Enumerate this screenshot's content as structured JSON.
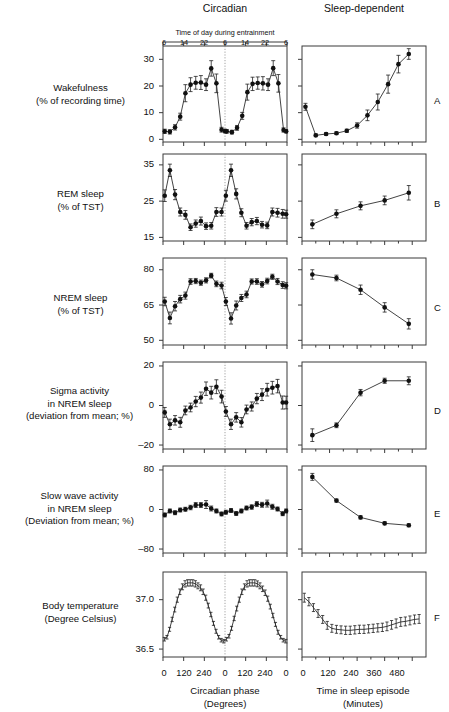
{
  "figure": {
    "column_headers": {
      "left": "Circadian",
      "right": "Sleep-dependent"
    },
    "top_axis_title": "Time of day during entrainment",
    "top_axis_ticks": [
      "6",
      "14",
      "22",
      "6",
      "14",
      "22",
      "6"
    ],
    "x_axis_left": {
      "title": "Circadian phase",
      "unit": "(Degrees)",
      "ticks": [
        "0",
        "120",
        "240",
        "0",
        "120",
        "240",
        "0"
      ]
    },
    "x_axis_right": {
      "title": "Time in sleep episode",
      "unit": "(Minutes)",
      "ticks": [
        "0",
        "120",
        "240",
        "360",
        "480"
      ]
    },
    "panel_letters": [
      "A",
      "B",
      "C",
      "D",
      "E",
      "F"
    ],
    "colors": {
      "axis": "#3b3b3b",
      "data": "#111111",
      "midline": "#8a8a8a",
      "background": "#ffffff"
    }
  },
  "chart_data": [
    {
      "type": "line",
      "panel": "A",
      "letter": "A",
      "row_label": [
        "Wakefulness",
        "(% of recording time)"
      ],
      "title": "Wakefulness (% of recording time)",
      "left": {
        "xlabel": "Circadian phase (Degrees)",
        "ylabel": "Wakefulness (% of recording time)",
        "ylim": [
          -1,
          35
        ],
        "yticks": [
          0,
          10,
          20,
          30
        ],
        "ytick_labels": [
          "0",
          "10",
          "20",
          "30"
        ],
        "xlim": [
          0,
          720
        ],
        "x": [
          10,
          40,
          70,
          100,
          130,
          160,
          190,
          220,
          250,
          280,
          310,
          340,
          360,
          370,
          400,
          430,
          460,
          490,
          520,
          550,
          580,
          610,
          640,
          670,
          700,
          715
        ],
        "y": [
          3.0,
          2.8,
          4.5,
          8.5,
          17.3,
          20.5,
          21.2,
          21.3,
          20.5,
          26.6,
          21.0,
          3.6,
          3.1,
          3.0,
          2.7,
          4.3,
          8.8,
          17.7,
          20.8,
          21.1,
          21.0,
          20.5,
          26.7,
          21.0,
          3.5,
          3.0
        ],
        "yerr": [
          0.8,
          0.8,
          1.0,
          1.3,
          3.2,
          2.6,
          2.4,
          2.6,
          2.2,
          2.9,
          3.5,
          0.9,
          0.7,
          0.7,
          0.7,
          0.9,
          1.3,
          3.0,
          2.5,
          2.3,
          2.5,
          2.2,
          2.8,
          3.3,
          0.8,
          0.6
        ]
      },
      "right": {
        "xlabel": "Time in sleep episode (Minutes)",
        "ylim": [
          -1,
          35
        ],
        "xlim": [
          0,
          540
        ],
        "x": [
          15,
          60,
          105,
          150,
          195,
          240,
          285,
          330,
          375,
          420,
          465,
          510
        ],
        "y": [
          12.2,
          1.5,
          2.0,
          2.3,
          3.2,
          5.2,
          9.0,
          14.0,
          20.7,
          28.2,
          32.0
        ],
        "yerr": [
          1.3,
          0.5,
          0.5,
          0.5,
          0.6,
          1.0,
          2.0,
          3.0,
          3.4,
          3.3,
          2.0
        ]
      }
    },
    {
      "type": "line",
      "panel": "B",
      "letter": "B",
      "row_label": [
        "REM sleep",
        "(% of TST)"
      ],
      "title": "REM sleep (% of TST)",
      "left": {
        "ylim": [
          14,
          38
        ],
        "yticks": [
          15,
          25,
          35
        ],
        "ytick_labels": [
          "15",
          "25",
          "35"
        ],
        "xlim": [
          0,
          720
        ],
        "x": [
          10,
          40,
          70,
          100,
          130,
          160,
          190,
          220,
          250,
          280,
          310,
          340,
          365,
          395,
          425,
          455,
          485,
          515,
          545,
          575,
          605,
          635,
          665,
          695,
          715
        ],
        "y": [
          26.5,
          33.5,
          26.8,
          22.0,
          21.2,
          17.8,
          18.8,
          19.5,
          18.1,
          18.2,
          22.0,
          22.0,
          26.5,
          33.5,
          27.0,
          21.8,
          18.2,
          19.2,
          19.5,
          18.5,
          18.3,
          22.0,
          21.8,
          21.5,
          21.4
        ],
        "yerr": [
          1.6,
          1.7,
          1.4,
          1.1,
          1.2,
          0.9,
          1.0,
          1.1,
          0.9,
          0.9,
          1.2,
          1.1,
          1.5,
          1.7,
          1.4,
          1.1,
          0.9,
          1.0,
          1.0,
          0.9,
          0.9,
          1.1,
          1.2,
          1.2,
          1.1
        ]
      },
      "right": {
        "ylim": [
          14,
          38
        ],
        "xlim": [
          0,
          540
        ],
        "x": [
          45,
          150,
          255,
          360,
          465
        ],
        "y": [
          18.6,
          21.5,
          23.7,
          25.2,
          27.3
        ],
        "yerr": [
          1.2,
          1.1,
          1.1,
          1.2,
          2.0
        ]
      }
    },
    {
      "type": "line",
      "panel": "C",
      "letter": "C",
      "row_label": [
        "NREM sleep",
        "(% of TST)"
      ],
      "title": "NREM sleep (% of TST)",
      "left": {
        "ylim": [
          48,
          85
        ],
        "yticks": [
          50,
          65,
          80
        ],
        "ytick_labels": [
          "50",
          "65",
          "80"
        ],
        "xlim": [
          0,
          720
        ],
        "x": [
          10,
          40,
          70,
          100,
          130,
          160,
          190,
          220,
          250,
          280,
          310,
          340,
          365,
          395,
          425,
          455,
          485,
          515,
          545,
          575,
          605,
          635,
          665,
          695,
          715
        ],
        "y": [
          66.5,
          59.5,
          64.5,
          67.5,
          69.0,
          75.0,
          75.2,
          74.5,
          75.5,
          77.5,
          74.0,
          73.3,
          66.5,
          59.3,
          64.8,
          68.0,
          69.5,
          75.0,
          75.0,
          73.8,
          75.2,
          77.0,
          75.0,
          73.5,
          73.2
        ],
        "yerr": [
          1.8,
          2.5,
          2.0,
          1.6,
          1.5,
          1.2,
          1.1,
          1.1,
          1.1,
          1.0,
          1.2,
          1.4,
          1.7,
          2.4,
          1.9,
          1.5,
          1.4,
          1.1,
          1.2,
          1.2,
          1.2,
          1.1,
          1.3,
          1.4,
          1.3
        ]
      },
      "right": {
        "ylim": [
          48,
          85
        ],
        "xlim": [
          0,
          540
        ],
        "x": [
          45,
          150,
          255,
          360,
          465
        ],
        "y": [
          78.0,
          76.5,
          71.5,
          64.0,
          57.0
        ],
        "yerr": [
          2.0,
          1.2,
          2.0,
          2.0,
          2.2
        ]
      }
    },
    {
      "type": "line",
      "panel": "D",
      "letter": "D",
      "row_label": [
        "Sigma activity",
        "in NREM sleep",
        "(deviation from mean; %)"
      ],
      "title": "Sigma activity in NREM sleep (deviation from mean; %)",
      "left": {
        "ylim": [
          -22,
          22
        ],
        "yticks": [
          -20,
          0,
          20
        ],
        "ytick_labels": [
          "–20",
          "0",
          "20"
        ],
        "xlim": [
          0,
          720
        ],
        "x": [
          10,
          40,
          70,
          100,
          130,
          160,
          190,
          220,
          250,
          280,
          310,
          340,
          365,
          395,
          425,
          455,
          485,
          515,
          545,
          575,
          605,
          635,
          665,
          695,
          715
        ],
        "y": [
          -3.5,
          -9.5,
          -7.5,
          -8.5,
          -2.5,
          -1.0,
          2.0,
          4.0,
          8.5,
          6.5,
          9.5,
          4.5,
          -3.0,
          -9.5,
          -6.0,
          -8.5,
          -2.0,
          -0.5,
          3.5,
          5.5,
          8.0,
          9.0,
          9.8,
          1.5,
          1.5
        ],
        "yerr": [
          2.5,
          2.6,
          2.4,
          2.5,
          2.2,
          2.2,
          2.6,
          2.8,
          3.4,
          3.2,
          3.5,
          3.2,
          2.5,
          2.6,
          2.4,
          2.4,
          2.2,
          2.3,
          2.6,
          3.0,
          3.2,
          3.2,
          3.4,
          3.3,
          3.2
        ]
      },
      "right": {
        "ylim": [
          -22,
          22
        ],
        "xlim": [
          0,
          540
        ],
        "x": [
          45,
          150,
          255,
          360,
          465
        ],
        "y": [
          -15.0,
          -10.0,
          6.5,
          12.5,
          12.5
        ],
        "yerr": [
          3.2,
          1.2,
          1.6,
          1.3,
          2.0
        ]
      }
    },
    {
      "type": "line",
      "panel": "E",
      "letter": "E",
      "row_label": [
        "Slow wave activity",
        "in NREM sleep",
        "(Deviation from mean; %)"
      ],
      "title": "Slow wave activity in NREM sleep (Deviation from mean; %)",
      "left": {
        "ylim": [
          -88,
          88
        ],
        "yticks": [
          -80,
          0,
          80
        ],
        "ytick_labels": [
          "–80",
          "0",
          "80"
        ],
        "xlim": [
          0,
          720
        ],
        "x": [
          10,
          40,
          70,
          100,
          130,
          160,
          190,
          220,
          250,
          280,
          310,
          340,
          365,
          395,
          425,
          455,
          485,
          515,
          545,
          575,
          605,
          635,
          665,
          695,
          715
        ],
        "y": [
          -11.0,
          -3.0,
          -6.5,
          -1.0,
          0.5,
          4.0,
          9.0,
          9.0,
          10.0,
          2.0,
          -3.0,
          -9.0,
          -5.5,
          -2.0,
          -8.0,
          -3.0,
          3.0,
          5.0,
          11.0,
          9.5,
          12.0,
          5.5,
          1.0,
          -8.5,
          -3.0
        ],
        "yerr": [
          4.0,
          4.0,
          4.0,
          4.0,
          4.0,
          4.5,
          5.0,
          5.0,
          8.0,
          5.0,
          4.0,
          4.0,
          4.0,
          4.0,
          4.0,
          4.0,
          4.0,
          4.5,
          5.0,
          5.0,
          7.0,
          5.0,
          4.0,
          4.0,
          4.0
        ]
      },
      "right": {
        "ylim": [
          -88,
          88
        ],
        "xlim": [
          0,
          540
        ],
        "x": [
          45,
          150,
          255,
          360,
          465
        ],
        "y": [
          66.0,
          18.0,
          -16.0,
          -28.0,
          -32.0
        ],
        "yerr": [
          7.0,
          3.0,
          3.0,
          3.0,
          3.0
        ]
      }
    },
    {
      "type": "line",
      "panel": "F",
      "letter": "F",
      "row_label": [
        "Body temperature",
        "(Degree Celsius)"
      ],
      "title": "Body temperature (Degree Celsius)",
      "left": {
        "ylim": [
          36.42,
          37.28
        ],
        "yticks": [
          36.5,
          37.0
        ],
        "ytick_labels": [
          "36.5",
          "37.0"
        ],
        "xlim": [
          0,
          720
        ],
        "x": [
          8,
          23,
          38,
          53,
          68,
          83,
          98,
          113,
          128,
          143,
          158,
          173,
          188,
          203,
          218,
          233,
          248,
          263,
          278,
          293,
          308,
          323,
          338,
          353,
          368,
          383,
          398,
          413,
          428,
          443,
          458,
          473,
          488,
          503,
          518,
          533,
          548,
          563,
          578,
          593,
          608,
          623,
          638,
          653,
          668,
          683,
          698,
          713
        ],
        "y": [
          36.6,
          36.62,
          36.7,
          36.8,
          36.9,
          37.0,
          37.08,
          37.13,
          37.16,
          37.17,
          37.17,
          37.17,
          37.16,
          37.14,
          37.12,
          37.08,
          37.02,
          36.94,
          36.85,
          36.76,
          36.68,
          36.62,
          36.59,
          36.58,
          36.6,
          36.63,
          36.71,
          36.81,
          36.91,
          37.0,
          37.08,
          37.13,
          37.16,
          37.17,
          37.17,
          37.17,
          37.16,
          37.14,
          37.11,
          37.07,
          37.01,
          36.93,
          36.84,
          36.75,
          36.67,
          36.62,
          36.59,
          36.58
        ],
        "yerr": [
          0.018,
          0.018,
          0.02,
          0.022,
          0.024,
          0.026,
          0.028,
          0.03,
          0.032,
          0.032,
          0.032,
          0.032,
          0.032,
          0.03,
          0.03,
          0.028,
          0.026,
          0.024,
          0.022,
          0.02,
          0.02,
          0.018,
          0.018,
          0.018,
          0.018,
          0.018,
          0.02,
          0.022,
          0.024,
          0.026,
          0.028,
          0.03,
          0.032,
          0.032,
          0.032,
          0.032,
          0.03,
          0.03,
          0.028,
          0.028,
          0.026,
          0.024,
          0.022,
          0.02,
          0.02,
          0.018,
          0.018,
          0.018
        ]
      },
      "right": {
        "ylim": [
          36.42,
          37.28
        ],
        "xlim": [
          0,
          540
        ],
        "x": [
          10,
          30,
          50,
          70,
          90,
          110,
          130,
          150,
          170,
          190,
          210,
          230,
          250,
          270,
          290,
          310,
          330,
          350,
          370,
          390,
          410,
          430,
          450,
          470,
          490,
          510
        ],
        "y": [
          37.02,
          36.98,
          36.92,
          36.86,
          36.8,
          36.74,
          36.71,
          36.7,
          36.695,
          36.69,
          36.69,
          36.695,
          36.7,
          36.7,
          36.705,
          36.71,
          36.715,
          36.72,
          36.73,
          36.745,
          36.76,
          36.775,
          36.78,
          36.79,
          36.8,
          36.805
        ],
        "yerr": [
          0.045,
          0.042,
          0.04,
          0.04,
          0.04,
          0.04,
          0.04,
          0.04,
          0.04,
          0.042,
          0.042,
          0.042,
          0.042,
          0.042,
          0.042,
          0.042,
          0.042,
          0.042,
          0.044,
          0.044,
          0.045,
          0.045,
          0.045,
          0.045,
          0.045,
          0.045
        ]
      }
    }
  ]
}
